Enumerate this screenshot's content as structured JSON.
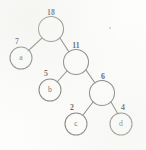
{
  "figure": {
    "kind": "binary-tree-diagram",
    "background_color": "#fdfdfc",
    "stroke_color": "#6b6b68",
    "text_color": "#3f3f3d",
    "width": 146,
    "height": 150
  },
  "nodes": [
    {
      "id": "root",
      "label": "",
      "cx": 51,
      "cy": 29,
      "r": 12.5
    },
    {
      "id": "a",
      "label": "a",
      "cx": 21,
      "cy": 58,
      "r": 11.0
    },
    {
      "id": "n11",
      "label": "",
      "cx": 76,
      "cy": 62,
      "r": 12.5
    },
    {
      "id": "b",
      "label": "b",
      "cx": 50,
      "cy": 90,
      "r": 11.0
    },
    {
      "id": "n6",
      "label": "",
      "cx": 102,
      "cy": 93,
      "r": 12.5
    },
    {
      "id": "c",
      "label": "c",
      "cx": 76,
      "cy": 124,
      "r": 11.0
    },
    {
      "id": "d",
      "label": "d",
      "cx": 121,
      "cy": 124,
      "r": 11.0
    }
  ],
  "edges": [
    {
      "id": "root-a",
      "from": "root",
      "to": "a",
      "weight": "7",
      "x1": 42,
      "y1": 38,
      "x2": 28,
      "y2": 51
    },
    {
      "id": "root-n11",
      "from": "root",
      "to": "n11",
      "weight": "11",
      "x1": 60,
      "y1": 38,
      "x2": 69,
      "y2": 52
    },
    {
      "id": "n11-b",
      "from": "n11",
      "to": "b",
      "weight": "5",
      "x1": 67,
      "y1": 71,
      "x2": 57,
      "y2": 82
    },
    {
      "id": "n11-n6",
      "from": "n11",
      "to": "n6",
      "weight": "6",
      "x1": 86,
      "y1": 70,
      "x2": 95,
      "y2": 83
    },
    {
      "id": "n6-c",
      "from": "n6",
      "to": "c",
      "weight": "2",
      "x1": 93,
      "y1": 102,
      "x2": 83,
      "y2": 115
    },
    {
      "id": "n6-d",
      "from": "n6",
      "to": "d",
      "weight": "4",
      "x1": 111,
      "y1": 102,
      "x2": 118,
      "y2": 114
    }
  ],
  "weight_labels": [
    {
      "id": "w-18",
      "text": "18",
      "x": 51,
      "y": 13
    },
    {
      "id": "w-7",
      "text": "7",
      "x": 17,
      "y": 42
    },
    {
      "id": "w-11",
      "text": "11",
      "x": 76,
      "y": 46
    },
    {
      "id": "w-5",
      "text": "5",
      "x": 46,
      "y": 74
    },
    {
      "id": "w-6",
      "text": "6",
      "x": 103,
      "y": 77
    },
    {
      "id": "w-2",
      "text": "2",
      "x": 72,
      "y": 108
    },
    {
      "id": "w-4",
      "text": "4",
      "x": 123,
      "y": 108
    }
  ],
  "artifacts": [
    {
      "id": "speck-top-right",
      "cx": 110,
      "cy": 28,
      "r": 1.1
    }
  ],
  "chart_data": {
    "type": "diagram",
    "title": "",
    "structure": "binary tree with weighted edges",
    "vertices": [
      "root",
      "a",
      "11",
      "b",
      "6",
      "c",
      "d"
    ],
    "leaf_labels": [
      "a",
      "b",
      "c",
      "d"
    ],
    "numeric_labels": [
      "18",
      "7",
      "11",
      "5",
      "6",
      "2",
      "4"
    ],
    "edges": [
      {
        "parent": "root",
        "child": "a",
        "weight": 7
      },
      {
        "parent": "root",
        "child": "11",
        "weight": 11
      },
      {
        "parent": "11",
        "child": "b",
        "weight": 5
      },
      {
        "parent": "11",
        "child": "6",
        "weight": 6
      },
      {
        "parent": "6",
        "child": "c",
        "weight": 2
      },
      {
        "parent": "6",
        "child": "d",
        "weight": 4
      }
    ],
    "root_value": 18
  }
}
